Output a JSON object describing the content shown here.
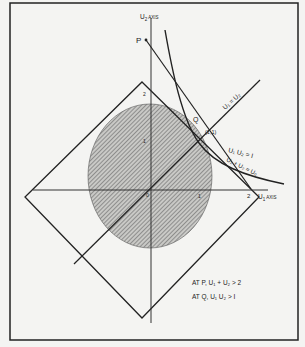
{
  "diagram": {
    "axes": {
      "u1_label": "U",
      "u1_sub": "1",
      "u1_suffix": " AXIS",
      "u2_label": "U",
      "u2_sub": "2",
      "u2_suffix": " AXIS",
      "tick_u1_1": "1",
      "tick_u1_2": "2",
      "tick_u2_1": "1",
      "tick_u2_2": "2",
      "origin": "0"
    },
    "points": {
      "P": "P",
      "Q": "Q",
      "one_one": "(1,1)"
    },
    "curves": {
      "line_u1_eq_u2": "U₁ = U₂",
      "hyperbola": "U₁ U₂ = I",
      "tangent_line": "U₁ + U₂ = U₀"
    },
    "annotations": [
      "AT P, U₁ + U₂ > 2",
      "AT Q, U₁ U₂ > I"
    ],
    "colors": {
      "ink": "#222222",
      "background": "#f4f4f2",
      "hatch": "#555555"
    }
  }
}
